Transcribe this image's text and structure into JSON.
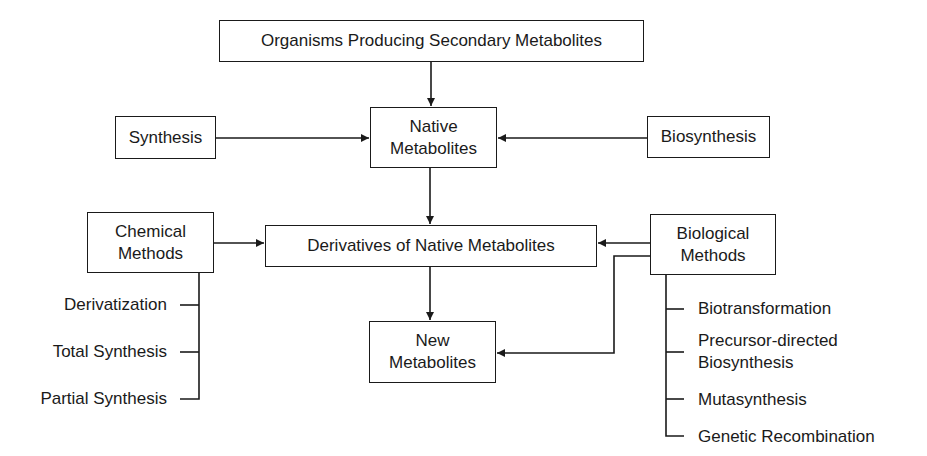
{
  "diagram": {
    "nodes": {
      "organisms": "Organisms Producing Secondary Metabolites",
      "native": [
        "Native",
        "Metabolites"
      ],
      "synthesis": "Synthesis",
      "biosynthesis": "Biosynthesis",
      "chemical": [
        "Chemical",
        "Methods"
      ],
      "derivatives": "Derivatives of Native Metabolites",
      "biological": [
        "Biological",
        "Methods"
      ],
      "new": [
        "New",
        "Metabolites"
      ]
    },
    "chemical_methods": [
      "Derivatization",
      "Total Synthesis",
      "Partial Synthesis"
    ],
    "biological_methods": [
      [
        "Biotransformation"
      ],
      [
        "Precursor-directed",
        "Biosynthesis"
      ],
      [
        "Mutasynthesis"
      ],
      [
        "Genetic Recombination"
      ]
    ],
    "edges": [
      {
        "from": "organisms",
        "to": "native"
      },
      {
        "from": "synthesis",
        "to": "native"
      },
      {
        "from": "biosynthesis",
        "to": "native"
      },
      {
        "from": "native",
        "to": "derivatives"
      },
      {
        "from": "chemical",
        "to": "derivatives"
      },
      {
        "from": "biological",
        "to": "derivatives"
      },
      {
        "from": "derivatives",
        "to": "new"
      },
      {
        "from": "biological",
        "to": "new"
      }
    ]
  }
}
